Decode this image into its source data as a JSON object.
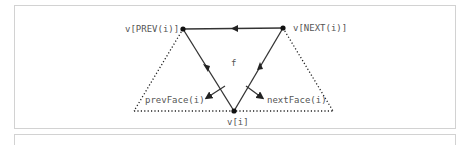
{
  "diagram": {
    "labels": {
      "v_prev": "v[PREV(i)]",
      "v_next": "v[NEXT(i)]",
      "v_i": "v[i]",
      "face": "f",
      "prev_face": "prevFace(i)",
      "next_face": "nextFace(i)"
    },
    "colors": {
      "line": "#333333",
      "dotted": "#222222",
      "text": "#555555",
      "frame": "#d2d2d2"
    }
  }
}
